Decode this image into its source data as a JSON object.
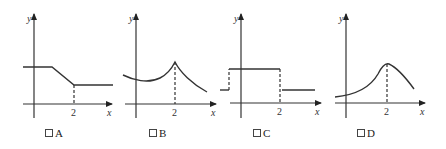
{
  "panels": [
    {
      "id": "A",
      "label": "A",
      "x_tick": "2",
      "x_axis": "x",
      "y_axis": "y",
      "shape": "constant, then linear decrease, then constant after x=2"
    },
    {
      "id": "B",
      "label": "B",
      "x_tick": "2",
      "x_axis": "x",
      "y_axis": "y",
      "shape": "slight dip then rising to cusp peak at x=2, then decaying"
    },
    {
      "id": "C",
      "label": "C",
      "x_tick": "2",
      "x_axis": "x",
      "y_axis": "y",
      "shape": "step function: low, high between jumps, low after x=2"
    },
    {
      "id": "D",
      "label": "D",
      "x_tick": "2",
      "x_axis": "x",
      "y_axis": "y",
      "shape": "rising smooth curve to rounded peak at x=2, then decreasing"
    }
  ],
  "colors": {
    "stroke": "#333333",
    "background": "#ffffff"
  }
}
